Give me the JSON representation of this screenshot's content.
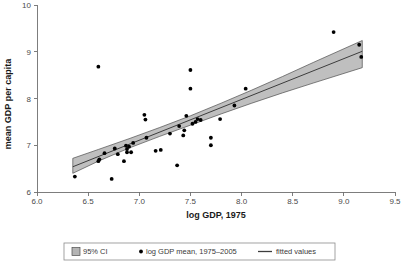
{
  "chart_data": {
    "type": "scatter",
    "title": "",
    "subtitle": "",
    "xlabel": "log GDP, 1975",
    "ylabel": "mean GDP per capita",
    "xlim": [
      6.0,
      9.5
    ],
    "ylim": [
      6,
      10
    ],
    "xticks": [
      6.0,
      6.5,
      7.0,
      7.5,
      8.0,
      8.5,
      9.0,
      9.5
    ],
    "xticklabels": [
      "6.0",
      "6.5",
      "7.0",
      "7.5",
      "8.0",
      "8.5",
      "9.0",
      "9.5"
    ],
    "yticks": [
      6,
      7,
      8,
      9,
      10
    ],
    "yticklabels": [
      "6",
      "7",
      "8",
      "9",
      "10"
    ],
    "grid": false,
    "legend_position": "bottom-center",
    "series": [
      {
        "name": "log GDP mean, 1975-2005",
        "type": "scatter",
        "marker": "circle",
        "color": "#000000",
        "points": [
          [
            6.37,
            6.33
          ],
          [
            6.6,
            8.68
          ],
          [
            6.6,
            6.66
          ],
          [
            6.61,
            6.7
          ],
          [
            6.66,
            6.83
          ],
          [
            6.73,
            6.28
          ],
          [
            6.76,
            6.93
          ],
          [
            6.79,
            6.81
          ],
          [
            6.85,
            6.66
          ],
          [
            6.87,
            6.99
          ],
          [
            6.88,
            6.92
          ],
          [
            6.88,
            6.85
          ],
          [
            6.9,
            6.97
          ],
          [
            6.92,
            6.85
          ],
          [
            6.94,
            7.05
          ],
          [
            7.05,
            7.65
          ],
          [
            7.06,
            7.55
          ],
          [
            7.07,
            7.16
          ],
          [
            7.16,
            6.88
          ],
          [
            7.21,
            6.9
          ],
          [
            7.3,
            7.25
          ],
          [
            7.37,
            6.57
          ],
          [
            7.39,
            7.41
          ],
          [
            7.43,
            7.21
          ],
          [
            7.44,
            7.32
          ],
          [
            7.46,
            7.63
          ],
          [
            7.5,
            8.61
          ],
          [
            7.5,
            8.21
          ],
          [
            7.52,
            7.46
          ],
          [
            7.55,
            7.5
          ],
          [
            7.57,
            7.56
          ],
          [
            7.6,
            7.54
          ],
          [
            7.7,
            7.16
          ],
          [
            7.7,
            7.0
          ],
          [
            7.79,
            7.56
          ],
          [
            7.93,
            7.85
          ],
          [
            8.04,
            8.21
          ],
          [
            8.9,
            9.42
          ],
          [
            9.15,
            9.15
          ],
          [
            9.17,
            8.89
          ]
        ]
      },
      {
        "name": "fitted values",
        "type": "line",
        "color": "#3d3d3d",
        "x": [
          6.35,
          9.18
        ],
        "y": [
          6.54,
          9.01
        ]
      },
      {
        "name": "95% CI",
        "type": "band",
        "color": "#b4b4b4",
        "x": [
          6.35,
          6.6,
          6.9,
          7.2,
          7.5,
          7.8,
          8.1,
          8.4,
          8.7,
          9.18
        ],
        "lower": [
          6.4,
          6.66,
          6.94,
          7.19,
          7.43,
          7.67,
          7.9,
          8.12,
          8.33,
          8.66
        ],
        "upper": [
          6.72,
          6.91,
          7.14,
          7.38,
          7.63,
          7.9,
          8.18,
          8.47,
          8.77,
          9.24
        ]
      }
    ],
    "legend": [
      {
        "label": "95% CI",
        "marker": "swatch",
        "color": "#b4b4b4"
      },
      {
        "label": "log GDP mean, 1975–2005",
        "marker": "dot",
        "color": "#000000"
      },
      {
        "label": "fitted values",
        "marker": "line",
        "color": "#3d3d3d"
      }
    ]
  }
}
